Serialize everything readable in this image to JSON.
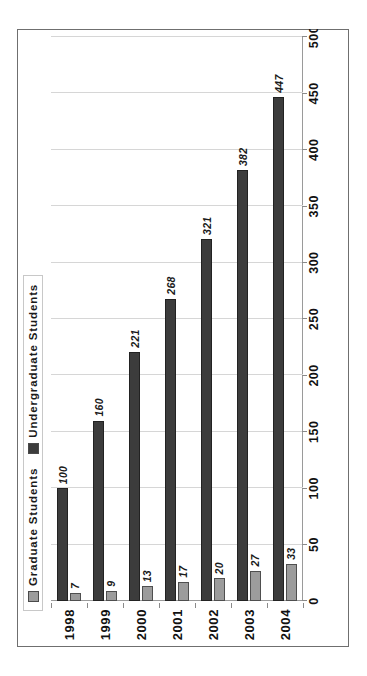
{
  "chart_data": {
    "type": "bar",
    "orientation": "horizontal-rotated",
    "title": "",
    "xlabel": "",
    "ylabel": "",
    "categories": [
      "1998",
      "1999",
      "2000",
      "2001",
      "2002",
      "2003",
      "2004"
    ],
    "series": [
      {
        "name": "Graduate Students",
        "color": "#9c9c9c",
        "values": [
          7,
          9,
          13,
          17,
          20,
          27,
          33
        ]
      },
      {
        "name": "Undergraduate Students",
        "color": "#3c3c3c",
        "values": [
          100,
          160,
          221,
          268,
          321,
          382,
          447
        ]
      }
    ],
    "value_axis": {
      "min": 0,
      "max": 500,
      "step": 50,
      "ticks": [
        "0",
        "50",
        "100",
        "150",
        "200",
        "250",
        "300",
        "350",
        "400",
        "450",
        "500"
      ]
    },
    "grid": true,
    "legend_position": "top",
    "data_labels": true
  },
  "legend": {
    "items": [
      {
        "label": "Graduate Students",
        "swatch": "#9c9c9c"
      },
      {
        "label": "Undergraduate Students",
        "swatch": "#3c3c3c"
      }
    ]
  }
}
